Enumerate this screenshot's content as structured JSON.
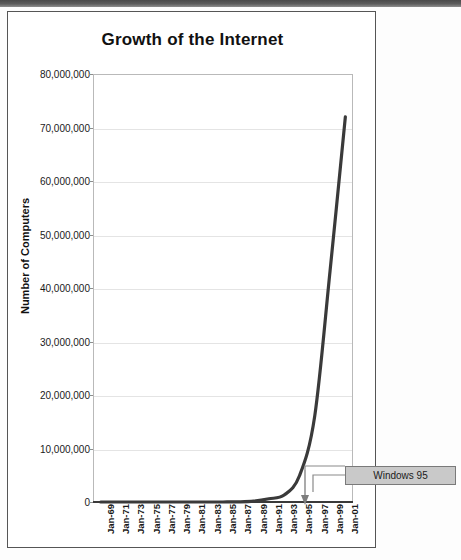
{
  "document": {
    "top_bar_color": "#4a4a4a",
    "page_background": "#fdfdfd"
  },
  "chart_data": {
    "type": "line",
    "title": "Growth of the Internet",
    "xlabel": "",
    "ylabel": "Number of Computers",
    "ylim": [
      0,
      80000000
    ],
    "grid": true,
    "legend": false,
    "line_color": "#3a3a3a",
    "ytick_labels": [
      "80,000,000",
      "70,000,000",
      "60,000,000",
      "50,000,000",
      "40,000,000",
      "30,000,000",
      "20,000,000",
      "10,000,000",
      "0"
    ],
    "ytick_values": [
      80000000,
      70000000,
      60000000,
      50000000,
      40000000,
      30000000,
      20000000,
      10000000,
      0
    ],
    "categories": [
      "Jan-69",
      "Jan-71",
      "Jan-73",
      "Jan-75",
      "Jan-77",
      "Jan-79",
      "Jan-81",
      "Jan-83",
      "Jan-85",
      "Jan-87",
      "Jan-89",
      "Jan-91",
      "Jan-93",
      "Jan-95",
      "Jan-97",
      "Jan-99",
      "Jan-01"
    ],
    "values": [
      0,
      0,
      0,
      0,
      0,
      0,
      0,
      0,
      2000,
      28000,
      160000,
      600000,
      1300000,
      4900000,
      16100000,
      43200000,
      72000000
    ],
    "annotations": [
      {
        "label": "Windows 95",
        "points_to_category": "Jan-95",
        "box_fill": "#c9c9c9",
        "box_border": "#7a7a7a"
      }
    ]
  }
}
